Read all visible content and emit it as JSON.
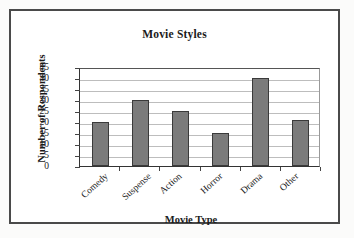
{
  "chart_data": {
    "type": "bar",
    "title": "Movie Styles",
    "xlabel": "Movie Type",
    "ylabel": "Number of Respondents",
    "categories": [
      "Comedy",
      "Suspense",
      "Action",
      "Horror",
      "Drama",
      "Other"
    ],
    "values": [
      20,
      30,
      25,
      15,
      40,
      21
    ],
    "ylim": [
      0,
      45
    ],
    "yticks": [
      0,
      5,
      10,
      15,
      20,
      25,
      30,
      35,
      40,
      45
    ],
    "ytick_labels": [
      "0",
      "5",
      "10",
      "15",
      "20",
      "25",
      "30",
      "35",
      "40",
      "45"
    ],
    "grid": true,
    "grid_axis": "y",
    "legend": false,
    "bar_color": "#7b7b7b",
    "bar_edge_color": "#3a3a3a",
    "plot_background": "#ffffff",
    "axis_color": "#333333",
    "gridline_color": "#bdbdbd",
    "xtick_label_rotation": -42
  }
}
